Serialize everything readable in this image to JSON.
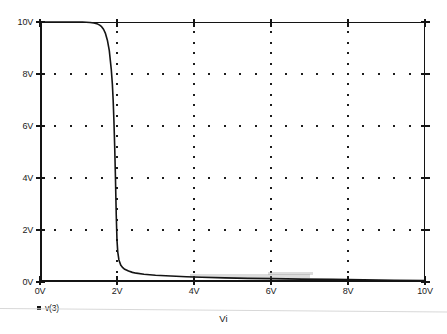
{
  "figure": {
    "background_color": "#ffffff",
    "ink_color": "#141414",
    "grid_dot_color": "#1c1c1c",
    "scan_rule_color": "#d8d8d8"
  },
  "legend": {
    "entries": [
      {
        "label": "v(3)",
        "marker": "filled-square",
        "color": "#121212"
      }
    ]
  },
  "axis_titles": {
    "x": "Vi",
    "y": ""
  },
  "chart_data": {
    "type": "line",
    "title": "",
    "subtitle": "",
    "xlabel": "Vi",
    "ylabel": "",
    "xlim": [
      0,
      10
    ],
    "ylim": [
      0,
      10
    ],
    "x_unit": "V",
    "y_unit": "V",
    "xticks": [
      0,
      2,
      4,
      6,
      8,
      10
    ],
    "yticks": [
      0,
      2,
      4,
      6,
      8,
      10
    ],
    "xticklabels": [
      "0V",
      "2V",
      "4V",
      "6V",
      "8V",
      "10V"
    ],
    "yticklabels": [
      "0V",
      "2V",
      "4V",
      "6V",
      "8V",
      "10V"
    ],
    "grid": "dotted-minor-dots-at-major-lines",
    "grid_minor_divisions": 5,
    "legend_position": "below-axes-left",
    "series": [
      {
        "name": "v(3)",
        "color": "#141414",
        "linewidth": 1.6,
        "x": [
          0,
          0.2,
          0.4,
          0.6,
          0.8,
          1.0,
          1.1,
          1.2,
          1.3,
          1.4,
          1.5,
          1.55,
          1.6,
          1.65,
          1.7,
          1.75,
          1.8,
          1.85,
          1.88,
          1.9,
          1.92,
          1.94,
          1.95,
          1.96,
          1.97,
          1.98,
          2.0,
          2.02,
          2.05,
          2.1,
          2.15,
          2.2,
          2.3,
          2.4,
          2.5,
          2.7,
          3.0,
          3.4,
          3.8,
          4.2,
          4.8,
          5.4,
          6.0,
          6.8,
          7.6,
          8.4,
          9.2,
          10.0
        ],
        "y": [
          10.0,
          10.0,
          10.0,
          10.0,
          10.0,
          10.0,
          10.0,
          9.99,
          9.98,
          9.96,
          9.92,
          9.88,
          9.82,
          9.72,
          9.56,
          9.3,
          8.9,
          8.2,
          7.6,
          7.0,
          6.2,
          5.2,
          4.6,
          4.0,
          3.3,
          2.6,
          1.6,
          1.15,
          0.85,
          0.64,
          0.55,
          0.49,
          0.42,
          0.37,
          0.34,
          0.3,
          0.26,
          0.23,
          0.2,
          0.18,
          0.16,
          0.14,
          0.13,
          0.11,
          0.1,
          0.08,
          0.07,
          0.06
        ]
      }
    ],
    "annotations": [
      {
        "text": "sharp transition near Vi = 2V"
      }
    ]
  }
}
